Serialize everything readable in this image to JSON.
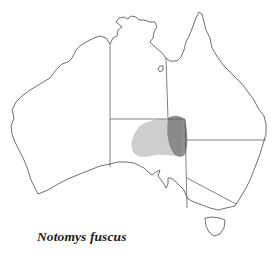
{
  "map": {
    "title": "Notomys fuscus",
    "region": "Australia",
    "legend": [],
    "colors": {
      "land_fill": "#ffffff",
      "outline": "#4a4a4a",
      "range_light": "#c9c9c9",
      "range_dark": "#7e7e7e"
    }
  }
}
